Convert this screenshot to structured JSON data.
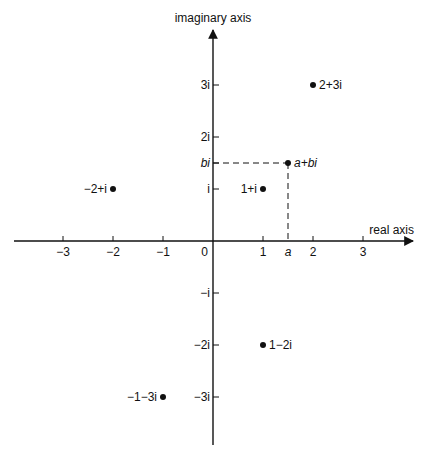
{
  "diagram": {
    "axes": {
      "x_label": "real axis",
      "y_label": "imaginary axis",
      "origin_label": "0",
      "x_ticks": [
        {
          "value": -3,
          "label": "−3"
        },
        {
          "value": -2,
          "label": "−2"
        },
        {
          "value": -1,
          "label": "−1"
        },
        {
          "value": 1,
          "label": "1"
        },
        {
          "value": 2,
          "label": "2"
        },
        {
          "value": 3,
          "label": "3"
        }
      ],
      "y_ticks": [
        {
          "value": 3,
          "label": "3i"
        },
        {
          "value": 2,
          "label": "2i"
        },
        {
          "value": 1,
          "label": "i"
        },
        {
          "value": -1,
          "label": "−i"
        },
        {
          "value": -2,
          "label": "−2i"
        },
        {
          "value": -3,
          "label": "−3i"
        }
      ],
      "a_label": "a",
      "b_label": "bi"
    },
    "points": [
      {
        "re": 2,
        "im": 3,
        "label": "2+3i",
        "side": "right"
      },
      {
        "re": 1,
        "im": 1,
        "label": "1+i",
        "side": "left"
      },
      {
        "re": -2,
        "im": 1,
        "label": "−2+i",
        "side": "left"
      },
      {
        "re": 1,
        "im": -2,
        "label": "1−2i",
        "side": "right"
      },
      {
        "re": -1,
        "im": -3,
        "label": "−1−3i",
        "side": "left"
      },
      {
        "re": 1.5,
        "im": 1.5,
        "label": "a+bi",
        "side": "right",
        "italic": true,
        "dashed_projection": true
      }
    ]
  }
}
